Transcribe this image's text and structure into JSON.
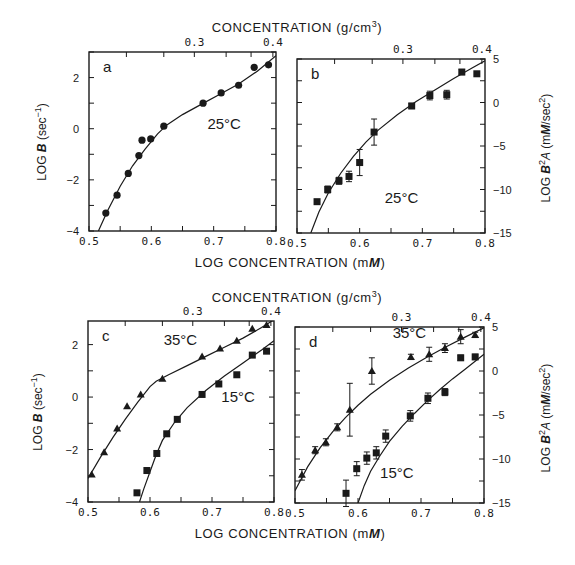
{
  "figure": {
    "top_axis_title": "CONCENTRATION (g/cm",
    "top_axis_title_sup": "3",
    "top_axis_title_end": ")",
    "bottom_axis_title": "LOG CONCENTRATION (m",
    "bottom_axis_title_italic": "M",
    "bottom_axis_title_end": ")",
    "left_axis_title_prefix": "LOG ",
    "left_axis_title_symbol": "B",
    "left_axis_title_unit": " (sec",
    "left_axis_title_sup": "−1",
    "left_axis_title_end": ")",
    "right_axis_title_prefix": "LOG ",
    "right_axis_title_symbol": "B",
    "right_axis_title_sup": "2",
    "right_axis_title_A": "A",
    "right_axis_title_unit": " (m",
    "right_axis_title_italic": "M",
    "right_axis_title_end": "/sec",
    "right_axis_title_sup2": "2",
    "right_axis_title_close": ")"
  },
  "chart_data": [
    {
      "panel": "a",
      "type": "scatter",
      "title": "",
      "xlabel": "LOG CONCENTRATION (mM)",
      "ylabel": "LOG B (sec^-1)",
      "top_xlabel": "CONCENTRATION (g/cm3)",
      "xlim": [
        0.5,
        0.8
      ],
      "ylim": [
        -4,
        3
      ],
      "xticks": [
        0.5,
        0.6,
        0.7,
        0.8
      ],
      "xticklabels": [
        "0.5",
        "0.6",
        "0.7",
        "0.8"
      ],
      "yticks": [
        -4,
        -2,
        0,
        2
      ],
      "yticklabels": [
        "−4",
        "−2",
        "0",
        "2"
      ],
      "top_ticks": [
        {
          "label": "0.3",
          "x": 0.669
        },
        {
          "label": "0.4",
          "x": 0.795
        }
      ],
      "annotations": [
        {
          "text": "25°C",
          "x": 0.69,
          "y": 0.0
        }
      ],
      "series": [
        {
          "name": "25°C",
          "marker": "circle",
          "x": [
            0.527,
            0.545,
            0.563,
            0.58,
            0.585,
            0.599,
            0.62,
            0.683,
            0.712,
            0.74,
            0.765,
            0.788
          ],
          "y": [
            -3.3,
            -2.6,
            -1.75,
            -1.05,
            -0.45,
            -0.4,
            0.1,
            1.0,
            1.4,
            1.7,
            2.4,
            2.5
          ],
          "fit_x": [
            0.515,
            0.53,
            0.55,
            0.57,
            0.59,
            0.61,
            0.625,
            0.65,
            0.68,
            0.71,
            0.74,
            0.77,
            0.8
          ],
          "fit_y": [
            -4.0,
            -3.2,
            -2.25,
            -1.45,
            -0.8,
            -0.2,
            0.15,
            0.55,
            0.95,
            1.35,
            1.75,
            2.25,
            2.85
          ]
        }
      ]
    },
    {
      "panel": "b",
      "type": "scatter",
      "title": "",
      "xlabel": "LOG CONCENTRATION (mM)",
      "ylabel": "LOG B^2 A (mM/sec^2)",
      "top_xlabel": "CONCENTRATION (g/cm3)",
      "xlim": [
        0.5,
        0.8
      ],
      "ylim": [
        -15,
        5
      ],
      "xticks": [
        0.5,
        0.6,
        0.7,
        0.8
      ],
      "xticklabels": [
        "0.5",
        "0.6",
        "0.7",
        "0.8"
      ],
      "yticks": [
        -15,
        -10,
        -5,
        0,
        5
      ],
      "yticklabels": [
        "−15",
        "−10",
        "−5",
        "0",
        "5"
      ],
      "top_ticks": [
        {
          "label": "0.3",
          "x": 0.669
        },
        {
          "label": "0.4",
          "x": 0.795
        }
      ],
      "annotations": [
        {
          "text": "25°C",
          "x": 0.64,
          "y": -11.5
        }
      ],
      "series": [
        {
          "name": "25°C",
          "marker": "square",
          "x": [
            0.532,
            0.549,
            0.567,
            0.583,
            0.6,
            0.623,
            0.683,
            0.712,
            0.739,
            0.763,
            0.787
          ],
          "y": [
            -11.4,
            -10.0,
            -9.0,
            -8.5,
            -6.9,
            -3.4,
            -0.4,
            0.8,
            0.9,
            3.5,
            3.3
          ],
          "yerr": [
            0,
            0.4,
            0.4,
            0.6,
            1.5,
            1.5,
            0.3,
            0.5,
            0.5,
            0.3,
            0
          ],
          "fit_x": [
            0.522,
            0.535,
            0.55,
            0.57,
            0.59,
            0.61,
            0.63,
            0.66,
            0.69,
            0.72,
            0.75,
            0.78,
            0.8
          ],
          "fit_y": [
            -15.0,
            -12.6,
            -10.4,
            -8.1,
            -6.2,
            -4.55,
            -3.15,
            -1.4,
            0.1,
            1.45,
            2.75,
            4.0,
            4.8
          ]
        }
      ]
    },
    {
      "panel": "c",
      "type": "scatter",
      "title": "",
      "xlabel": "LOG CONCENTRATION (mM)",
      "ylabel": "LOG B (sec^-1)",
      "top_xlabel": "CONCENTRATION (g/cm3)",
      "xlim": [
        0.5,
        0.8
      ],
      "ylim": [
        -4,
        2.9
      ],
      "xticks": [
        0.5,
        0.6,
        0.7,
        0.8
      ],
      "xticklabels": [
        "0.5",
        "0.6",
        "0.7",
        "0.8"
      ],
      "yticks": [
        -4,
        -2,
        0,
        2
      ],
      "yticklabels": [
        "−4",
        "−2",
        "0",
        "2"
      ],
      "top_ticks": [
        {
          "label": "0.3",
          "x": 0.669
        },
        {
          "label": "0.4",
          "x": 0.795
        }
      ],
      "annotations": [
        {
          "text": "35°C",
          "x": 0.622,
          "y": 2.0
        },
        {
          "text": "15°C",
          "x": 0.715,
          "y": -0.2
        }
      ],
      "series": [
        {
          "name": "35°C",
          "marker": "triangle",
          "x": [
            0.506,
            0.526,
            0.547,
            0.563,
            0.585,
            0.62,
            0.684,
            0.713,
            0.74,
            0.765,
            0.788
          ],
          "y": [
            -2.95,
            -2.1,
            -1.2,
            -0.35,
            0.1,
            0.7,
            1.55,
            1.85,
            2.15,
            2.6,
            2.75
          ],
          "fit_x": [
            0.5,
            0.52,
            0.54,
            0.56,
            0.58,
            0.6,
            0.61,
            0.63,
            0.66,
            0.69,
            0.72,
            0.75,
            0.78,
            0.8
          ],
          "fit_y": [
            -3.1,
            -2.3,
            -1.55,
            -0.85,
            -0.2,
            0.4,
            0.6,
            0.85,
            1.2,
            1.55,
            1.9,
            2.25,
            2.65,
            2.95
          ]
        },
        {
          "name": "15°C",
          "marker": "square",
          "x": [
            0.579,
            0.595,
            0.611,
            0.627,
            0.644,
            0.684,
            0.711,
            0.74,
            0.765,
            0.788
          ],
          "y": [
            -3.65,
            -2.8,
            -2.15,
            -1.4,
            -0.85,
            0.1,
            0.5,
            0.85,
            1.6,
            1.75
          ],
          "fit_x": [
            0.583,
            0.59,
            0.6,
            0.61,
            0.62,
            0.64,
            0.66,
            0.69,
            0.72,
            0.75,
            0.78,
            0.8
          ],
          "fit_y": [
            -4.0,
            -3.5,
            -2.85,
            -2.2,
            -1.65,
            -0.95,
            -0.4,
            0.25,
            0.8,
            1.3,
            1.8,
            2.15
          ]
        }
      ]
    },
    {
      "panel": "d",
      "type": "scatter",
      "title": "",
      "xlabel": "LOG CONCENTRATION (mM)",
      "ylabel": "LOG B^2 A (mM/sec^2)",
      "top_xlabel": "CONCENTRATION (g/cm3)",
      "xlim": [
        0.5,
        0.8
      ],
      "ylim": [
        -15,
        5
      ],
      "xticks": [
        0.5,
        0.6,
        0.7,
        0.8
      ],
      "xticklabels": [
        "0.5",
        "0.6",
        "0.7",
        "0.8"
      ],
      "yticks": [
        -15,
        -10,
        -5,
        0,
        5
      ],
      "yticklabels": [
        "−15",
        "−10",
        "−5",
        "0",
        "5"
      ],
      "top_ticks": [
        {
          "label": "0.3",
          "x": 0.669
        },
        {
          "label": "0.4",
          "x": 0.795
        }
      ],
      "annotations": [
        {
          "text": "35°C",
          "x": 0.655,
          "y": 3.7
        },
        {
          "text": "15°C",
          "x": 0.635,
          "y": -12.2
        }
      ],
      "series": [
        {
          "name": "35°C",
          "marker": "triangle",
          "x": [
            0.511,
            0.532,
            0.549,
            0.567,
            0.587,
            0.622,
            0.684,
            0.713,
            0.738,
            0.763,
            0.786
          ],
          "y": [
            -11.8,
            -9.0,
            -8.1,
            -6.4,
            -4.4,
            0.0,
            1.6,
            1.9,
            2.6,
            3.9,
            4.1
          ],
          "yerr": [
            0.6,
            0.4,
            0.4,
            0.4,
            3.0,
            1.5,
            0.3,
            0.8,
            0.5,
            0.8,
            0.3
          ],
          "fit_x": [
            0.5,
            0.52,
            0.54,
            0.56,
            0.58,
            0.6,
            0.62,
            0.65,
            0.68,
            0.71,
            0.74,
            0.77,
            0.8
          ],
          "fit_y": [
            -13.6,
            -10.9,
            -8.7,
            -6.9,
            -5.3,
            -3.9,
            -2.65,
            -1.05,
            0.35,
            1.6,
            2.75,
            3.85,
            4.9
          ]
        },
        {
          "name": "15°C",
          "marker": "square",
          "x": [
            0.581,
            0.598,
            0.614,
            0.629,
            0.644,
            0.683,
            0.711,
            0.738,
            0.763,
            0.786
          ],
          "y": [
            -13.9,
            -11.1,
            -9.9,
            -9.3,
            -7.4,
            -5.1,
            -3.1,
            -2.4,
            1.5,
            1.6
          ],
          "yerr": [
            1.5,
            0.8,
            0.7,
            0.7,
            0.7,
            0.6,
            0.6,
            0.4,
            0.3,
            0.3
          ],
          "fit_x": [
            0.6,
            0.61,
            0.62,
            0.635,
            0.65,
            0.67,
            0.69,
            0.71,
            0.73,
            0.75,
            0.77,
            0.8
          ],
          "fit_y": [
            -15.0,
            -13.0,
            -11.4,
            -9.6,
            -8.0,
            -6.3,
            -4.8,
            -3.4,
            -2.1,
            -0.9,
            0.2,
            1.9
          ]
        }
      ]
    }
  ]
}
